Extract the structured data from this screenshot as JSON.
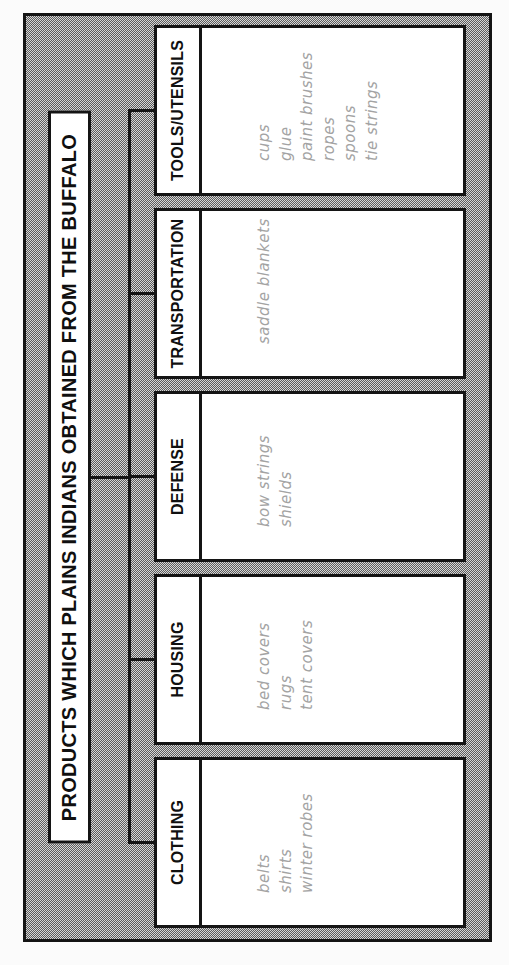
{
  "diagram": {
    "title": "PRODUCTS WHICH PLAINS INDIANS OBTAINED FROM THE BUFFALO",
    "categories": [
      {
        "label": "CLOTHING",
        "items": [
          "belts",
          "shirts",
          "winter robes"
        ]
      },
      {
        "label": "HOUSING",
        "items": [
          "bed covers",
          "rugs",
          "tent covers"
        ]
      },
      {
        "label": "DEFENSE",
        "items": [
          "bow strings",
          "shields"
        ]
      },
      {
        "label": "TRANSPORTATION",
        "items": [
          "saddle blankets"
        ]
      },
      {
        "label": "TOOLS/UTENSILS",
        "items": [
          "cups",
          "glue",
          "paint brushes",
          "ropes",
          "spoons",
          "tie strings"
        ]
      }
    ],
    "colors": {
      "line": "#141414",
      "box_fill": "#ffffff",
      "item_text": "#a3a3a3",
      "dither_dark": "#5c5c5c",
      "dither_light": "#d6d6d6",
      "page_bg": "#fbfbfb"
    }
  }
}
